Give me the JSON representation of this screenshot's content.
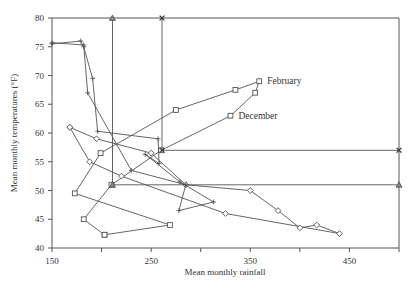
{
  "chart_data": {
    "type": "line",
    "title": "",
    "xlabel": "Mean monthly rainfall",
    "ylabel": "Mean monthly temperatures (°F)",
    "xlim": [
      150,
      500
    ],
    "ylim": [
      40,
      80
    ],
    "x_ticks": [
      150,
      200,
      250,
      300,
      350,
      400,
      450,
      500
    ],
    "x_tick_labels": [
      "150",
      "",
      "250",
      "",
      "350",
      "",
      "450",
      ""
    ],
    "y_ticks": [
      40,
      45,
      50,
      55,
      60,
      65,
      70,
      75,
      80
    ],
    "y_tick_labels": [
      "40",
      "45",
      "50",
      "55",
      "60",
      "65",
      "70",
      "75",
      "80"
    ],
    "grid": false,
    "legend": "none",
    "annotations": [
      {
        "text": "February",
        "x": 359,
        "y": 69
      },
      {
        "text": "December",
        "x": 330,
        "y": 63
      }
    ],
    "series": [
      {
        "name": "square-series",
        "marker": "square",
        "points": [
          [
            203,
            42.3
          ],
          [
            182,
            45
          ],
          [
            210,
            51
          ],
          [
            260,
            57
          ],
          [
            330,
            63
          ],
          [
            355,
            67
          ],
          [
            359,
            69
          ],
          [
            335,
            67.5
          ],
          [
            275,
            64
          ],
          [
            199,
            56.5
          ],
          [
            173,
            49.5
          ],
          [
            269,
            44
          ],
          [
            203,
            42.3
          ]
        ]
      },
      {
        "name": "diamond-series",
        "marker": "diamond",
        "points": [
          [
            168,
            61
          ],
          [
            195,
            59
          ],
          [
            250,
            56.5
          ],
          [
            285,
            51
          ],
          [
            350,
            50
          ],
          [
            378,
            46.5
          ],
          [
            400,
            43.5
          ],
          [
            417,
            44
          ],
          [
            440,
            42.5
          ],
          [
            325,
            46
          ],
          [
            220,
            52.5
          ],
          [
            188,
            55
          ],
          [
            168,
            61
          ]
        ]
      },
      {
        "name": "plus-series",
        "marker": "plus",
        "points": [
          [
            150,
            75.5
          ],
          [
            179,
            76
          ],
          [
            182,
            75
          ],
          [
            191,
            69.5
          ],
          [
            196,
            60.3
          ],
          [
            257,
            59
          ],
          [
            258,
            54.7
          ],
          [
            244,
            56.3
          ],
          [
            279,
            51.5
          ],
          [
            313,
            48
          ],
          [
            278,
            46.5
          ],
          [
            285,
            51
          ],
          [
            230,
            53.5
          ],
          [
            186,
            67
          ],
          [
            182,
            75.3
          ],
          [
            150,
            75.7
          ]
        ]
      },
      {
        "name": "triangle-series",
        "marker": "triangle",
        "points": [
          [
            211,
            80
          ],
          [
            211,
            51
          ],
          [
            500,
            51
          ]
        ]
      },
      {
        "name": "x-series",
        "marker": "x",
        "points": [
          [
            261,
            80
          ],
          [
            261,
            57
          ],
          [
            500,
            57
          ]
        ]
      }
    ]
  },
  "plot_area": {
    "left": 52,
    "top": 18,
    "right": 399,
    "bottom": 248
  },
  "colors": {
    "line": "#555555",
    "text": "#333333",
    "background": "#ffffff"
  }
}
